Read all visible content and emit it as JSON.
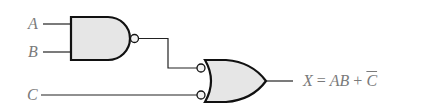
{
  "diagram": {
    "type": "logic-circuit",
    "inputs": [
      {
        "label": "A"
      },
      {
        "label": "B"
      },
      {
        "label": "C"
      }
    ],
    "gates": [
      {
        "id": "g1",
        "kind": "NAND",
        "inputs": [
          "A",
          "B"
        ]
      },
      {
        "id": "g2",
        "kind": "OR",
        "inverted_inputs": true,
        "inputs": [
          "g1",
          "C"
        ]
      }
    ],
    "output": {
      "var": "X",
      "eq": "=",
      "term1": "AB",
      "plus": "+",
      "term2": "C",
      "term2_negated": true,
      "full": "X = AB + C̄"
    },
    "colors": {
      "gate_fill": "#e6e6e6",
      "stroke": "#111111",
      "label": "#7a7a7a"
    }
  }
}
